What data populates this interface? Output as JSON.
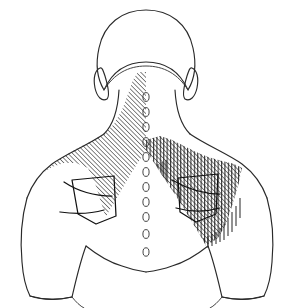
{
  "figure": {
    "title": "Posterior upper-body pain distribution diagram",
    "view": "posterior (from behind)",
    "background_color": "#ffffff",
    "outline_color": "#2a2a2a",
    "hatch_color": "#1a1a1a",
    "width": 294,
    "height": 308
  },
  "body_parts": [
    {
      "id": "head",
      "name": "head-outline",
      "label": "Head"
    },
    {
      "id": "ear-left",
      "name": "ear-left",
      "label": "Left ear"
    },
    {
      "id": "ear-right",
      "name": "ear-right",
      "label": "Right ear"
    },
    {
      "id": "neck",
      "name": "neck-outline",
      "label": "Neck"
    },
    {
      "id": "torso",
      "name": "torso-outline",
      "label": "Upper back / torso"
    },
    {
      "id": "sleeve-left",
      "name": "sleeve-left",
      "label": "Left sleeve"
    },
    {
      "id": "sleeve-right",
      "name": "sleeve-right",
      "label": "Right sleeve"
    },
    {
      "id": "arm-left",
      "name": "arm-left",
      "label": "Left arm"
    },
    {
      "id": "arm-right",
      "name": "arm-right",
      "label": "Right arm"
    },
    {
      "id": "scapula-left",
      "name": "scapula-left",
      "label": "Left scapula"
    },
    {
      "id": "scapula-right",
      "name": "scapula-right",
      "label": "Right scapula"
    }
  ],
  "spine": {
    "name": "spinous-process-column",
    "label": "Spinous processes",
    "count": 11,
    "marker_shape": "small vertical oval",
    "marker_color": "#2f2f2f"
  },
  "shaded_regions": [
    {
      "id": "region-left",
      "name": "shaded-region-left",
      "label": "Left posterior neck, trapezius and upper back",
      "pattern": "single diagonal hatching",
      "direction": "upper-left to lower-right",
      "density": "moderate",
      "spacing_px": 3.2,
      "color": "#1a1a1a"
    },
    {
      "id": "region-right",
      "name": "shaded-region-right",
      "label": "Right trapezius, shoulder and upper back",
      "pattern": "cross hatching (diagonal plus vertical)",
      "direction": "upper-left to lower-right plus vertical",
      "density": "dense",
      "spacing_px": 3.2,
      "color": "#1a1a1a"
    }
  ],
  "legend": {
    "present": false,
    "note": "No legend, labels, axis text or numbers appear in this figure"
  }
}
